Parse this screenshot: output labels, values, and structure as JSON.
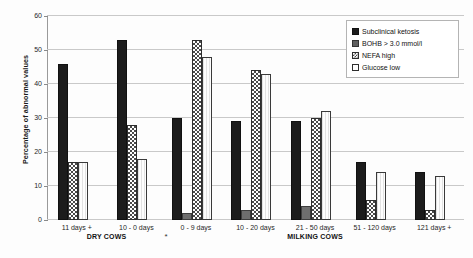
{
  "chart_data": {
    "type": "bar",
    "title": "",
    "xlabel": "",
    "ylabel": "Percentage of abnormal values",
    "ylim": [
      0,
      60
    ],
    "yticks": [
      0,
      10,
      20,
      30,
      40,
      50,
      60
    ],
    "grid": true,
    "legend_position": "top-right",
    "categories": [
      "11 days +",
      "10 - 0 days",
      "0 - 9 days",
      "10 - 20 days",
      "21 - 50 days",
      "51 - 120 days",
      "121 days +"
    ],
    "group_labels": [
      {
        "label": "DRY COWS",
        "categories": [
          "11 days +",
          "10 - 0 days"
        ]
      },
      {
        "label": "MILKING COWS",
        "categories": [
          "0 - 9 days",
          "10 - 20 days",
          "21 - 50 days",
          "51 - 120 days",
          "121 days +"
        ]
      }
    ],
    "annotations": [
      {
        "text": "*",
        "between": [
          "10 - 0 days",
          "0 - 9 days"
        ]
      }
    ],
    "series": [
      {
        "name": "Subclinical ketosis",
        "values": [
          46,
          53,
          30,
          29,
          29,
          17,
          14
        ]
      },
      {
        "name": "BOHB > 3.0 mmol/l",
        "values": [
          0,
          0,
          2,
          3,
          4,
          0,
          0
        ]
      },
      {
        "name": "NEFA high",
        "values": [
          17,
          28,
          53,
          44,
          30,
          6,
          3
        ]
      },
      {
        "name": "Glucose low",
        "values": [
          17,
          18,
          48,
          43,
          32,
          14,
          13
        ]
      }
    ]
  },
  "legend": {
    "items": [
      {
        "label": "Subclinical ketosis",
        "swatch": "sk",
        "color": "#1c1c1c"
      },
      {
        "label": "BOHB > 3.0 mmol/l",
        "swatch": "bohb",
        "color": "#5f5f5f"
      },
      {
        "label": "NEFA high",
        "swatch": "nefa",
        "color": "#4a4a4a"
      },
      {
        "label": "Glucose low",
        "swatch": "glu",
        "color": "#fdfdfd"
      }
    ]
  },
  "axis": {
    "y_title": "Percentage of abnormal values",
    "y_labels": [
      "60",
      "50",
      "40",
      "30",
      "20",
      "10",
      "0"
    ]
  }
}
